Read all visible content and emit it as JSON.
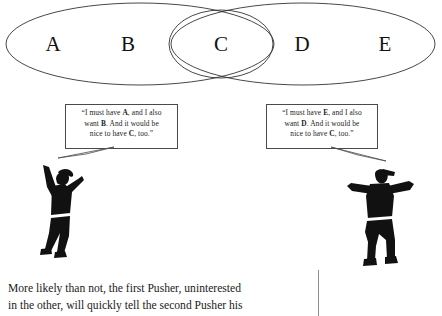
{
  "figure": {
    "type": "venn-diagram-illustration",
    "venn": {
      "labels": [
        {
          "text": "A",
          "x": 53,
          "y": 44
        },
        {
          "text": "B",
          "x": 128,
          "y": 44
        },
        {
          "text": "C",
          "x": 221,
          "y": 44
        },
        {
          "text": "D",
          "x": 302,
          "y": 44
        },
        {
          "text": "E",
          "x": 385,
          "y": 44
        }
      ],
      "left_ellipse": {
        "cx": 140,
        "cy": 44,
        "rx": 134,
        "ry": 41
      },
      "right_ellipse": {
        "cx": 303,
        "cy": 44,
        "rx": 132,
        "ry": 41
      },
      "center_ellipse": {
        "cx": 221,
        "cy": 44,
        "rx": 52,
        "ry": 34
      },
      "stroke_color": "#333333"
    },
    "speech_left": {
      "line1_a": "“I must have ",
      "line1_b": "A",
      "line1_c": ", and I also",
      "line2_a": "want ",
      "line2_b": "B",
      "line2_c": ". And it would be",
      "line3_a": "nice to have ",
      "line3_b": "C",
      "line3_c": ", too.”"
    },
    "speech_right": {
      "line1_a": "“I must have ",
      "line1_b": "E",
      "line1_c": ", and I also",
      "line2_a": "want ",
      "line2_b": "D",
      "line2_c": ". And it would be",
      "line3_a": "nice to have ",
      "line3_b": "C",
      "line3_c": ", too.”"
    },
    "figures": {
      "left_name": "pusher-figure-left",
      "right_name": "pusher-figure-right",
      "silhouette_color": "#111111"
    },
    "caption": {
      "line1": "More likely than not, the first Pusher, uninterested",
      "line2": "in the other, will quickly tell the second Pusher his"
    }
  }
}
